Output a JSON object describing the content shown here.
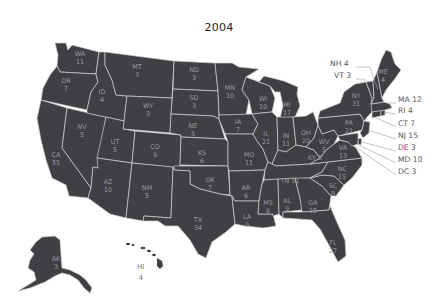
{
  "title": "2004",
  "colors": {
    "state_fill": "#3f3f44",
    "border": "#cfcfcf",
    "label": "#9a9aa0",
    "background": "#ffffff"
  },
  "states": [
    {
      "abbr": "WA",
      "ev": "11",
      "x": 80,
      "y": 57
    },
    {
      "abbr": "OR",
      "ev": "7",
      "x": 66,
      "y": 84
    },
    {
      "abbr": "CA",
      "ev": "55",
      "x": 56,
      "y": 158
    },
    {
      "abbr": "NV",
      "ev": "5",
      "x": 82,
      "y": 130
    },
    {
      "abbr": "ID",
      "ev": "4",
      "x": 102,
      "y": 95
    },
    {
      "abbr": "MT",
      "ev": "3",
      "x": 137,
      "y": 70
    },
    {
      "abbr": "WY",
      "ev": "3",
      "x": 148,
      "y": 109
    },
    {
      "abbr": "UT",
      "ev": "5",
      "x": 115,
      "y": 145
    },
    {
      "abbr": "CO",
      "ev": "9",
      "x": 155,
      "y": 150
    },
    {
      "abbr": "AZ",
      "ev": "10",
      "x": 108,
      "y": 185
    },
    {
      "abbr": "NM",
      "ev": "5",
      "x": 147,
      "y": 191
    },
    {
      "abbr": "ND",
      "ev": "3",
      "x": 194,
      "y": 73
    },
    {
      "abbr": "SD",
      "ev": "3",
      "x": 194,
      "y": 101
    },
    {
      "abbr": "NE",
      "ev": "5",
      "x": 193,
      "y": 129
    },
    {
      "abbr": "KS",
      "ev": "6",
      "x": 202,
      "y": 156
    },
    {
      "abbr": "OK",
      "ev": "7",
      "x": 210,
      "y": 183
    },
    {
      "abbr": "TX",
      "ev": "34",
      "x": 198,
      "y": 223
    },
    {
      "abbr": "MN",
      "ev": "10",
      "x": 230,
      "y": 91
    },
    {
      "abbr": "IA",
      "ev": "7",
      "x": 238,
      "y": 125
    },
    {
      "abbr": "MO",
      "ev": "11",
      "x": 249,
      "y": 158
    },
    {
      "abbr": "AR",
      "ev": "6",
      "x": 246,
      "y": 191
    },
    {
      "abbr": "LA",
      "ev": "9",
      "x": 247,
      "y": 220
    },
    {
      "abbr": "WI",
      "ev": "10",
      "x": 263,
      "y": 102
    },
    {
      "abbr": "IL",
      "ev": "21",
      "x": 266,
      "y": 137
    },
    {
      "abbr": "MI",
      "ev": "17",
      "x": 287,
      "y": 108
    },
    {
      "abbr": "IN",
      "ev": "11",
      "x": 286,
      "y": 139
    },
    {
      "abbr": "OH",
      "ev": "20",
      "x": 306,
      "y": 136
    },
    {
      "abbr": "KY",
      "ev": "8",
      "x": "",
      "y": 0
    },
    {
      "abbr": "TN",
      "ev": "11",
      "x": "",
      "y": 0
    },
    {
      "abbr": "MS",
      "ev": "6",
      "x": 268,
      "y": 206
    },
    {
      "abbr": "AL",
      "ev": "9",
      "x": 287,
      "y": 204
    },
    {
      "abbr": "GA",
      "ev": "15",
      "x": 313,
      "y": 206
    },
    {
      "abbr": "FL",
      "ev": "27",
      "x": 333,
      "y": 246
    },
    {
      "abbr": "SC",
      "ev": "8",
      "x": 333,
      "y": 189
    },
    {
      "abbr": "NC",
      "ev": "15",
      "x": 342,
      "y": 172
    },
    {
      "abbr": "VA",
      "ev": "13",
      "x": 343,
      "y": 151
    },
    {
      "abbr": "WV",
      "ev": "5",
      "x": 324,
      "y": 145
    },
    {
      "abbr": "PA",
      "ev": "21",
      "x": 349,
      "y": 126
    },
    {
      "abbr": "NY",
      "ev": "31",
      "x": 356,
      "y": 99
    },
    {
      "abbr": "ME",
      "ev": "4",
      "x": 383,
      "y": 75
    },
    {
      "abbr": "AK",
      "ev": "3",
      "x": 56,
      "y": 262
    },
    {
      "abbr": "HI",
      "ev": "4",
      "x": 0,
      "y": 0
    }
  ],
  "inline_labels": [
    {
      "text": "KY 8",
      "x": 315,
      "y": 158
    },
    {
      "text": "TN 11",
      "x": 290,
      "y": 181
    }
  ],
  "callouts": [
    {
      "text": "NH 4",
      "x": 330,
      "y": 63
    },
    {
      "text": "VT 3",
      "x": 334,
      "y": 75
    },
    {
      "text": "MA 12",
      "x": 398,
      "y": 99
    },
    {
      "text": "RI 4",
      "x": 398,
      "y": 110
    },
    {
      "text": "CT 7",
      "x": 398,
      "y": 123
    },
    {
      "text": "NJ 15",
      "x": 398,
      "y": 135
    },
    {
      "text": "DE 3",
      "x": 398,
      "y": 147
    },
    {
      "text": "MD 10",
      "x": 398,
      "y": 159
    },
    {
      "text": "DC 3",
      "x": 398,
      "y": 171
    }
  ],
  "hawaii_label": {
    "abbr": "HI",
    "ev": "4"
  }
}
